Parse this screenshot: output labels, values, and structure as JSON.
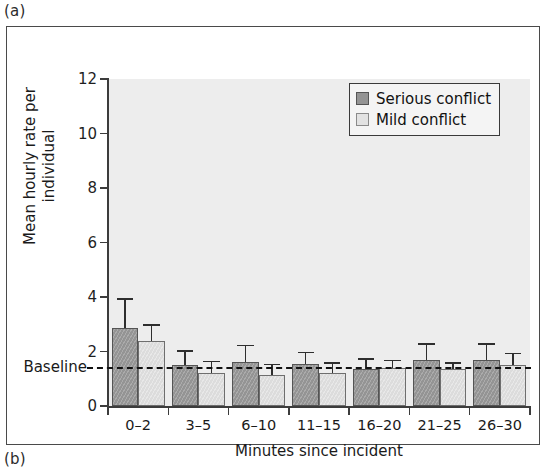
{
  "panels": {
    "a_label": "(a)",
    "b_label": "(b)"
  },
  "chart_data": {
    "type": "bar",
    "title": "",
    "xlabel": "Minutes since incident",
    "ylabel": "Mean hourly rate per individual",
    "categories": [
      "0–2",
      "3–5",
      "6–10",
      "11–15",
      "16–20",
      "21–25",
      "26–30"
    ],
    "ylim": [
      0,
      12
    ],
    "yticks": [
      0,
      2,
      4,
      6,
      8,
      10,
      12
    ],
    "ytick_labels": [
      "0",
      "2",
      "4",
      "6",
      "8",
      "10",
      "12"
    ],
    "grid": false,
    "legend_position": "top-right",
    "series": [
      {
        "name": "Serious conflict",
        "color": "#949494",
        "values": [
          2.85,
          1.5,
          1.6,
          1.55,
          1.35,
          1.7,
          1.7
        ],
        "errors_upper": [
          3.95,
          2.05,
          2.25,
          2.0,
          1.75,
          2.3,
          2.3
        ]
      },
      {
        "name": "Mild conflict",
        "color": "#dcdcdc",
        "values": [
          2.4,
          1.2,
          1.15,
          1.2,
          1.4,
          1.35,
          1.5
        ],
        "errors_upper": [
          3.0,
          1.65,
          1.55,
          1.6,
          1.7,
          1.6,
          1.95
        ]
      }
    ],
    "reference_line": {
      "label": "Baseline",
      "value": 1.43,
      "style": "dashed"
    },
    "annotations": []
  },
  "legend": {
    "items": [
      {
        "label": "Serious conflict",
        "swatch": "serious"
      },
      {
        "label": "Mild conflict",
        "swatch": "mild"
      }
    ]
  }
}
